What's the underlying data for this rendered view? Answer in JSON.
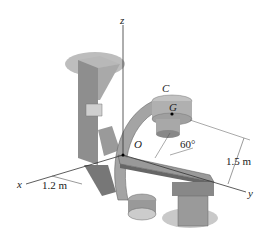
{
  "diagram": {
    "axes": {
      "x": "x",
      "y": "y",
      "z": "z"
    },
    "points": {
      "origin": "O",
      "c": "C",
      "g": "G"
    },
    "dimensions": {
      "horizontal": "1.2 m",
      "vertical": "1.5 m",
      "angle": "60°"
    }
  }
}
